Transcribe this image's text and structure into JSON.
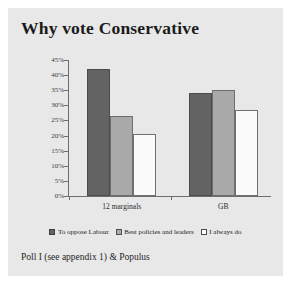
{
  "figure": {
    "title": "Why vote Conservative",
    "caption": "Poll I (see appendix 1) & Populus",
    "background_color": "#e8e8e8",
    "page_color": "#ffffff"
  },
  "chart_data": {
    "type": "bar",
    "title": "Why vote Conservative",
    "xlabel": "",
    "ylabel": "",
    "categories": [
      "12 marginals",
      "GB"
    ],
    "series": [
      {
        "name": "To oppose Labour",
        "values": [
          42,
          34
        ],
        "color": "#636363"
      },
      {
        "name": "Best policies and leaders",
        "values": [
          26.5,
          35
        ],
        "color": "#a9a9a9"
      },
      {
        "name": "I always do",
        "values": [
          20.5,
          28.5
        ],
        "color": "#ffffff"
      }
    ],
    "ylim": [
      0,
      45
    ],
    "ytick_values": [
      0,
      5,
      10,
      15,
      20,
      25,
      30,
      35,
      40,
      45
    ],
    "ytick_labels": [
      "0%",
      "5%",
      "10%",
      "15%",
      "20%",
      "25%",
      "30%",
      "35%",
      "40%",
      "45%"
    ],
    "grid": false,
    "legend_position": "bottom"
  }
}
